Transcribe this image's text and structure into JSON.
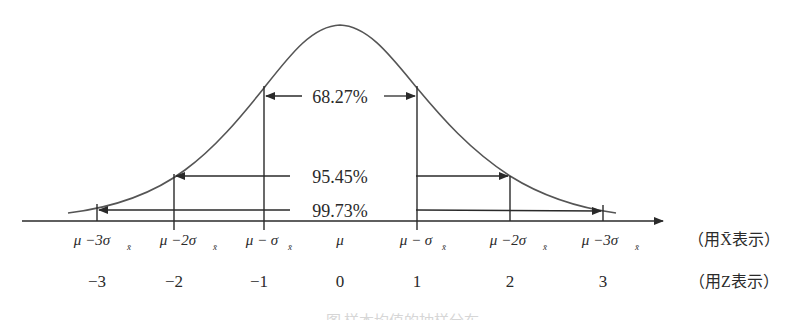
{
  "diagram": {
    "type": "normal-distribution-sampling",
    "intervals": [
      {
        "label": "68.27%",
        "range": "±1σ"
      },
      {
        "label": "95.45%",
        "range": "±2σ"
      },
      {
        "label": "99.73%",
        "range": "±3σ"
      }
    ],
    "xbar_axis": {
      "ticks": [
        "μ −3σ",
        "μ −2σ",
        "μ − σ",
        "μ",
        "μ − σ",
        "μ −2σ",
        "μ −3σ"
      ],
      "subscript": "x̄",
      "note": "（用X̄表示）"
    },
    "z_axis": {
      "ticks": [
        "−3",
        "−2",
        "−1",
        "0",
        "1",
        "2",
        "3"
      ],
      "note": "（用Z表示）"
    },
    "caption": "图 样本均值的抽样分布"
  }
}
